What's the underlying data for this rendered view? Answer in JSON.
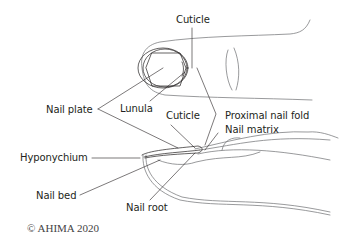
{
  "diagram": {
    "labels": {
      "cuticle_top": "Cuticle",
      "nail_plate": "Nail plate",
      "lunula": "Lunula",
      "cuticle_side": "Cuticle",
      "proximal_nail_fold": "Proximal nail fold",
      "nail_matrix": "Nail matrix",
      "hyponychium": "Hyponychium",
      "nail_bed": "Nail bed",
      "nail_root": "Nail root"
    },
    "copyright": "© AHIMA 2020"
  }
}
